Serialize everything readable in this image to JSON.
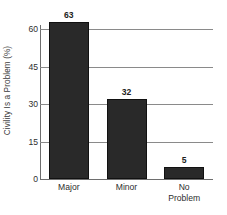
{
  "chart_data": {
    "type": "bar",
    "title": "",
    "subtitle": "",
    "xlabel": "",
    "ylabel": "Civility Is a Problem (%)",
    "categories": [
      "Major",
      "Minor",
      "No Problem"
    ],
    "category_lines": [
      [
        "Major"
      ],
      [
        "Minor"
      ],
      [
        "No",
        "Problem"
      ]
    ],
    "values": [
      63,
      32,
      5
    ],
    "value_labels": [
      "63",
      "32",
      "5"
    ],
    "ylim": [
      0,
      63
    ],
    "y_ticks": [
      60,
      45,
      30,
      15,
      0
    ],
    "y_tick_labels": [
      "60",
      "45",
      "30",
      "15",
      "0"
    ],
    "grid": "horizontal",
    "legend": "none",
    "bar_color": "#292929",
    "bar_edge_color": "#111111",
    "grid_color": "#8a8a8a",
    "axis_color": "#6e6e6e",
    "text_color": "#2e2e2e",
    "background_color": "#ffffff"
  }
}
